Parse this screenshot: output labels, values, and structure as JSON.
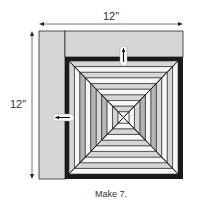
{
  "dimensions": {
    "width_label": "12\"",
    "height_label": "12\""
  },
  "caption": "Make 7.",
  "colors": {
    "outline": "#2a2a2a",
    "border_black": "#1a1a1a",
    "light_gray": "#d6d6d6",
    "white": "#f7f7f7",
    "mid_gray": "#b4b4b4",
    "dim_line": "#555555"
  },
  "block": {
    "outer": {
      "x": 39,
      "y": 31,
      "w": 144,
      "h": 148
    },
    "left_strip_width": 26,
    "top_strip_height": 26,
    "black_border_width": 4,
    "rings": 10
  },
  "arrows": [
    {
      "name": "pressing-arrow-up",
      "direction": "up"
    },
    {
      "name": "pressing-arrow-left",
      "direction": "left"
    }
  ]
}
